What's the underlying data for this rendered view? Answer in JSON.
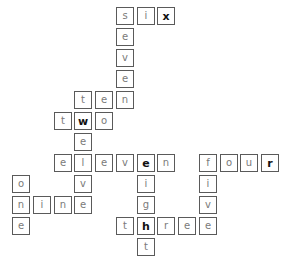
{
  "puzzle": {
    "grid": {
      "origin_x": 12,
      "origin_y": 7,
      "pitch_x": 20.75,
      "pitch_y": 21
    },
    "colors": {
      "border": "#5a5a5a",
      "letter": "#7a7a7a",
      "highlight_letter": "#111111",
      "background": "#ffffff"
    },
    "words": [
      {
        "word": "six",
        "direction": "across",
        "row": 0,
        "col": 5
      },
      {
        "word": "seven",
        "direction": "down",
        "row": 0,
        "col": 5
      },
      {
        "word": "ten",
        "direction": "across",
        "row": 4,
        "col": 3
      },
      {
        "word": "two",
        "direction": "across",
        "row": 5,
        "col": 2
      },
      {
        "word": "twelve",
        "direction": "down",
        "row": 4,
        "col": 3
      },
      {
        "word": "eleven",
        "direction": "across",
        "row": 7,
        "col": 2
      },
      {
        "word": "four",
        "direction": "across",
        "row": 7,
        "col": 9
      },
      {
        "word": "five",
        "direction": "down",
        "row": 7,
        "col": 9
      },
      {
        "word": "eight",
        "direction": "down",
        "row": 7,
        "col": 6
      },
      {
        "word": "one",
        "direction": "down",
        "row": 8,
        "col": 0
      },
      {
        "word": "nine",
        "direction": "across",
        "row": 9,
        "col": 0
      },
      {
        "word": "three",
        "direction": "across",
        "row": 10,
        "col": 5
      }
    ],
    "cells": [
      {
        "r": 0,
        "c": 5,
        "ch": "s",
        "bold": false
      },
      {
        "r": 0,
        "c": 6,
        "ch": "i",
        "bold": false
      },
      {
        "r": 0,
        "c": 7,
        "ch": "x",
        "bold": true
      },
      {
        "r": 1,
        "c": 5,
        "ch": "e",
        "bold": false
      },
      {
        "r": 2,
        "c": 5,
        "ch": "v",
        "bold": false
      },
      {
        "r": 3,
        "c": 5,
        "ch": "e",
        "bold": false
      },
      {
        "r": 4,
        "c": 3,
        "ch": "t",
        "bold": false
      },
      {
        "r": 4,
        "c": 4,
        "ch": "e",
        "bold": false
      },
      {
        "r": 4,
        "c": 5,
        "ch": "n",
        "bold": false
      },
      {
        "r": 5,
        "c": 2,
        "ch": "t",
        "bold": false
      },
      {
        "r": 5,
        "c": 3,
        "ch": "w",
        "bold": true
      },
      {
        "r": 5,
        "c": 4,
        "ch": "o",
        "bold": false
      },
      {
        "r": 6,
        "c": 3,
        "ch": "e",
        "bold": false
      },
      {
        "r": 7,
        "c": 2,
        "ch": "e",
        "bold": false
      },
      {
        "r": 7,
        "c": 3,
        "ch": "l",
        "bold": false
      },
      {
        "r": 7,
        "c": 4,
        "ch": "e",
        "bold": false
      },
      {
        "r": 7,
        "c": 5,
        "ch": "v",
        "bold": false
      },
      {
        "r": 7,
        "c": 6,
        "ch": "e",
        "bold": true
      },
      {
        "r": 7,
        "c": 7,
        "ch": "n",
        "bold": false
      },
      {
        "r": 7,
        "c": 9,
        "ch": "f",
        "bold": false
      },
      {
        "r": 7,
        "c": 10,
        "ch": "o",
        "bold": false
      },
      {
        "r": 7,
        "c": 11,
        "ch": "u",
        "bold": false
      },
      {
        "r": 7,
        "c": 12,
        "ch": "r",
        "bold": true
      },
      {
        "r": 8,
        "c": 0,
        "ch": "o",
        "bold": false
      },
      {
        "r": 8,
        "c": 3,
        "ch": "v",
        "bold": false
      },
      {
        "r": 8,
        "c": 6,
        "ch": "i",
        "bold": false
      },
      {
        "r": 8,
        "c": 9,
        "ch": "i",
        "bold": false
      },
      {
        "r": 9,
        "c": 0,
        "ch": "n",
        "bold": false
      },
      {
        "r": 9,
        "c": 1,
        "ch": "i",
        "bold": false
      },
      {
        "r": 9,
        "c": 2,
        "ch": "n",
        "bold": false
      },
      {
        "r": 9,
        "c": 3,
        "ch": "e",
        "bold": false
      },
      {
        "r": 9,
        "c": 6,
        "ch": "g",
        "bold": false
      },
      {
        "r": 9,
        "c": 9,
        "ch": "v",
        "bold": false
      },
      {
        "r": 10,
        "c": 0,
        "ch": "e",
        "bold": false
      },
      {
        "r": 10,
        "c": 5,
        "ch": "t",
        "bold": false
      },
      {
        "r": 10,
        "c": 6,
        "ch": "h",
        "bold": true
      },
      {
        "r": 10,
        "c": 7,
        "ch": "r",
        "bold": false
      },
      {
        "r": 10,
        "c": 8,
        "ch": "e",
        "bold": false
      },
      {
        "r": 10,
        "c": 9,
        "ch": "e",
        "bold": false
      },
      {
        "r": 11,
        "c": 6,
        "ch": "t",
        "bold": false
      }
    ]
  }
}
